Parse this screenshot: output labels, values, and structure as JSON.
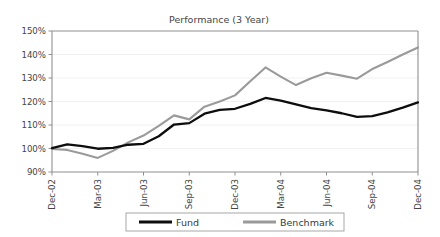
{
  "chart_data": {
    "type": "line",
    "title": "Performance (3 Year)",
    "xlabel": "",
    "ylabel": "",
    "ylim": [
      90,
      150
    ],
    "ytick_values": [
      90,
      100,
      110,
      120,
      130,
      140,
      150
    ],
    "ytick_labels": [
      "90%",
      "100%",
      "110%",
      "120%",
      "130%",
      "140%",
      "150%"
    ],
    "grid": true,
    "legend_position": "bottom",
    "x": [
      "Dec-02",
      "Jan-03",
      "Feb-03",
      "Mar-03",
      "Apr-03",
      "May-03",
      "Jun-03",
      "Jul-03",
      "Aug-03",
      "Sep-03",
      "Oct-03",
      "Nov-03",
      "Dec-03",
      "Jan-04",
      "Feb-04",
      "Mar-04",
      "Apr-04",
      "May-04",
      "Jun-04",
      "Jul-04",
      "Aug-04",
      "Sep-04",
      "Oct-04",
      "Nov-04",
      "Dec-04"
    ],
    "xtick_labels": [
      "Dec-02",
      "Mar-03",
      "Jun-03",
      "Sep-03",
      "Dec-03",
      "Mar-04",
      "Jun-04",
      "Sep-04",
      "Dec-04"
    ],
    "xtick_indices": [
      0,
      3,
      6,
      9,
      12,
      15,
      18,
      21,
      24
    ],
    "xtick_rotation": 90,
    "series": [
      {
        "name": "Fund",
        "color": "#0d0d0d",
        "values": [
          100.2,
          101.8,
          101.0,
          99.9,
          100.3,
          101.6,
          102.0,
          105.2,
          110.2,
          110.8,
          114.8,
          116.4,
          116.9,
          119.0,
          121.5,
          120.4,
          118.8,
          117.2,
          116.2,
          115.0,
          113.5,
          113.8,
          115.4,
          117.4,
          119.6
        ]
      },
      {
        "name": "Benchmark",
        "color": "#9a9a9a",
        "values": [
          99.8,
          99.4,
          97.8,
          96.0,
          99.0,
          102.6,
          105.5,
          109.6,
          114.1,
          112.4,
          117.8,
          120.0,
          122.6,
          128.6,
          134.5,
          130.6,
          127.0,
          129.9,
          132.2,
          131.0,
          129.7,
          133.8,
          136.8,
          140.0,
          143.0
        ]
      }
    ]
  },
  "legend": {
    "items": [
      {
        "label": "Fund",
        "color": "#0d0d0d"
      },
      {
        "label": "Benchmark",
        "color": "#9a9a9a"
      }
    ]
  }
}
